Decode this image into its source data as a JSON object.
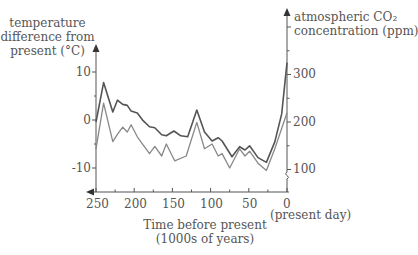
{
  "chart_data": {
    "type": "line",
    "title": "",
    "xlabel": "Time before present (1000s of years)",
    "xlabel_lines": [
      "Time before present",
      "(1000s of years)"
    ],
    "x_end_label": "(present day)",
    "ylabel_left": "temperature difference from present (°C)",
    "ylabel_left_lines": [
      "temperature",
      "difference from",
      "present (°C)"
    ],
    "ylabel_right": "atmospheric CO₂ concentration (ppm)",
    "ylabel_right_lines": [
      "atmospheric CO₂",
      "concentration (ppm)"
    ],
    "x_ticks": [
      250,
      200,
      150,
      100,
      50,
      0
    ],
    "x_tick_labels": [
      "250",
      "200",
      "150",
      "100",
      "50",
      "0"
    ],
    "xlim": [
      250,
      0
    ],
    "y_left_ticks": [
      10,
      0,
      -10
    ],
    "y_left_tick_labels": [
      "10",
      "0",
      "-10"
    ],
    "y_right_ticks": [
      300,
      200,
      100
    ],
    "y_right_tick_labels": [
      "300",
      "200",
      "100"
    ],
    "grid": false,
    "legend": null,
    "series": [
      {
        "name": "atmospheric CO2 concentration (ppm)",
        "axis": "right",
        "color": "#555555",
        "x": [
          250,
          240,
          228,
          222,
          215,
          209,
          204,
          196,
          189,
          180,
          173,
          164,
          158,
          148,
          139,
          130,
          118,
          108,
          98,
          90,
          85,
          72,
          62,
          55,
          49,
          38,
          27,
          16,
          7,
          0
        ],
        "values": [
          200,
          283,
          221,
          246,
          237,
          235,
          223,
          219,
          204,
          190,
          188,
          173,
          171,
          181,
          171,
          169,
          225,
          179,
          160,
          167,
          160,
          127,
          148,
          141,
          150,
          125,
          115,
          158,
          217,
          325
        ]
      },
      {
        "name": "temperature difference from present (°C)",
        "axis": "left",
        "color": "#888888",
        "x": [
          250,
          240,
          228,
          222,
          215,
          209,
          204,
          196,
          180,
          173,
          164,
          158,
          147,
          132,
          118,
          108,
          98,
          90,
          85,
          75,
          62,
          55,
          49,
          38,
          27,
          16,
          0
        ],
        "values": [
          -6,
          3.5,
          -4.5,
          -3,
          -1.5,
          -2.5,
          -1,
          -3.5,
          -7,
          -5.5,
          -7.5,
          -5,
          -8.5,
          -7.5,
          -0.5,
          -6,
          -5,
          -7.5,
          -7,
          -10,
          -6,
          -7.5,
          -6.5,
          -9,
          -10.5,
          -6,
          1.5
        ]
      }
    ]
  }
}
